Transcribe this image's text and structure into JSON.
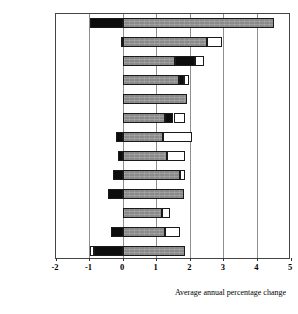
{
  "chart_data": {
    "type": "bar",
    "orientation": "horizontal",
    "stacked": true,
    "title": "",
    "xlabel": "Average annual percentage change",
    "ylabel": "",
    "xlim": [
      -2,
      5
    ],
    "xticks": [
      -2,
      -1,
      0,
      1,
      2,
      3,
      4,
      5
    ],
    "xtick_labels": [
      "-2",
      "-1",
      "0",
      "1",
      "2",
      "3",
      "4",
      "5"
    ],
    "grid": true,
    "grid_axis": "x",
    "legend": "none",
    "categories": [
      "Ireland",
      "Finland",
      "Sweden",
      "Denmark",
      "Australia",
      "US",
      "UK",
      "Italy",
      "Norway",
      "Germany",
      "Canada",
      "France",
      "Netherlands"
    ],
    "series": [
      {
        "name": "black-segment",
        "color": "#0d0d0d",
        "segments": [
          {
            "category": "Ireland",
            "start": -1.0,
            "end": 0.0
          },
          {
            "category": "Finland",
            "start": -0.05,
            "end": 0.0
          },
          {
            "category": "Sweden",
            "start": 1.55,
            "end": 2.15
          },
          {
            "category": "Denmark",
            "start": 1.65,
            "end": 1.8
          },
          {
            "category": "Australia",
            "start": 0.0,
            "end": 0.0
          },
          {
            "category": "US",
            "start": 1.25,
            "end": 1.5
          },
          {
            "category": "UK",
            "start": -0.2,
            "end": 0.0
          },
          {
            "category": "Italy",
            "start": -0.15,
            "end": 0.0
          },
          {
            "category": "Norway",
            "start": -0.3,
            "end": 0.0
          },
          {
            "category": "Germany",
            "start": -0.45,
            "end": 0.0
          },
          {
            "category": "Canada",
            "start": 0.0,
            "end": 0.0
          },
          {
            "category": "France",
            "start": -0.35,
            "end": 0.0
          },
          {
            "category": "Netherlands",
            "start": -0.88,
            "end": 0.0
          }
        ]
      },
      {
        "name": "gray-segment",
        "color": "#8a8a8a",
        "segments": [
          {
            "category": "Ireland",
            "start": 0.0,
            "end": 4.5
          },
          {
            "category": "Finland",
            "start": 0.0,
            "end": 2.5
          },
          {
            "category": "Sweden",
            "start": 0.0,
            "end": 1.55
          },
          {
            "category": "Denmark",
            "start": 0.0,
            "end": 1.65
          },
          {
            "category": "Australia",
            "start": 0.0,
            "end": 1.9
          },
          {
            "category": "US",
            "start": 0.0,
            "end": 1.25
          },
          {
            "category": "UK",
            "start": 0.0,
            "end": 1.2
          },
          {
            "category": "Italy",
            "start": 0.0,
            "end": 1.3
          },
          {
            "category": "Norway",
            "start": 0.0,
            "end": 1.7
          },
          {
            "category": "Germany",
            "start": 0.0,
            "end": 1.8
          },
          {
            "category": "Canada",
            "start": 0.0,
            "end": 1.15
          },
          {
            "category": "France",
            "start": 0.0,
            "end": 1.25
          },
          {
            "category": "Netherlands",
            "start": 0.0,
            "end": 1.85
          }
        ]
      },
      {
        "name": "white-segment",
        "color": "#ffffff",
        "segments": [
          {
            "category": "Ireland",
            "start": 4.5,
            "end": 4.5
          },
          {
            "category": "Finland",
            "start": 2.5,
            "end": 2.95
          },
          {
            "category": "Sweden",
            "start": 2.15,
            "end": 2.4
          },
          {
            "category": "Denmark",
            "start": 1.8,
            "end": 1.95
          },
          {
            "category": "Australia",
            "start": 1.9,
            "end": 1.9
          },
          {
            "category": "US",
            "start": 1.5,
            "end": 1.85
          },
          {
            "category": "UK",
            "start": 1.2,
            "end": 2.05
          },
          {
            "category": "Italy",
            "start": 1.3,
            "end": 1.85
          },
          {
            "category": "Norway",
            "start": 1.7,
            "end": 1.85
          },
          {
            "category": "Germany",
            "start": 1.8,
            "end": 1.8
          },
          {
            "category": "Canada",
            "start": 1.15,
            "end": 1.4
          },
          {
            "category": "France",
            "start": 1.25,
            "end": 1.7
          },
          {
            "category": "Netherlands",
            "start": -1.0,
            "end": -0.88
          }
        ]
      }
    ],
    "totals": [
      4.5,
      2.95,
      2.4,
      1.95,
      1.9,
      1.85,
      2.05,
      1.85,
      1.85,
      1.8,
      1.4,
      1.7,
      1.85
    ]
  }
}
